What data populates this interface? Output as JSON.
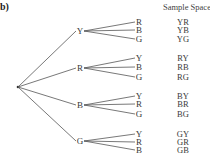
{
  "part_label": "b)",
  "sample_space_header": "Sample Space",
  "tree": {
    "root": {
      "x": 18,
      "y": 87
    },
    "first_level": [
      {
        "label": "Y",
        "x": 80,
        "y": 31,
        "children": [
          {
            "label": "R",
            "y": 22,
            "outcome": "YR"
          },
          {
            "label": "B",
            "y": 30,
            "outcome": "YB"
          },
          {
            "label": "G",
            "y": 39,
            "outcome": "YG"
          }
        ]
      },
      {
        "label": "R",
        "x": 80,
        "y": 68,
        "children": [
          {
            "label": "Y",
            "y": 58,
            "outcome": "RY"
          },
          {
            "label": "B",
            "y": 67,
            "outcome": "RB"
          },
          {
            "label": "G",
            "y": 77,
            "outcome": "RG"
          }
        ]
      },
      {
        "label": "B",
        "x": 80,
        "y": 105,
        "children": [
          {
            "label": "Y",
            "y": 96,
            "outcome": "BY"
          },
          {
            "label": "R",
            "y": 104,
            "outcome": "BR"
          },
          {
            "label": "G",
            "y": 114,
            "outcome": "BG"
          }
        ]
      },
      {
        "label": "G",
        "x": 80,
        "y": 141,
        "children": [
          {
            "label": "Y",
            "y": 134,
            "outcome": "GY"
          },
          {
            "label": "R",
            "y": 142,
            "outcome": "GR"
          },
          {
            "label": "B",
            "y": 150,
            "outcome": "GB"
          }
        ]
      }
    ]
  },
  "sample_space": [
    "YR",
    "YB",
    "YG",
    "RY",
    "RB",
    "RG",
    "BY",
    "BR",
    "BG",
    "GY",
    "GR",
    "GB"
  ],
  "colors": {
    "line": "#555555",
    "text": "#3a3a3a"
  }
}
